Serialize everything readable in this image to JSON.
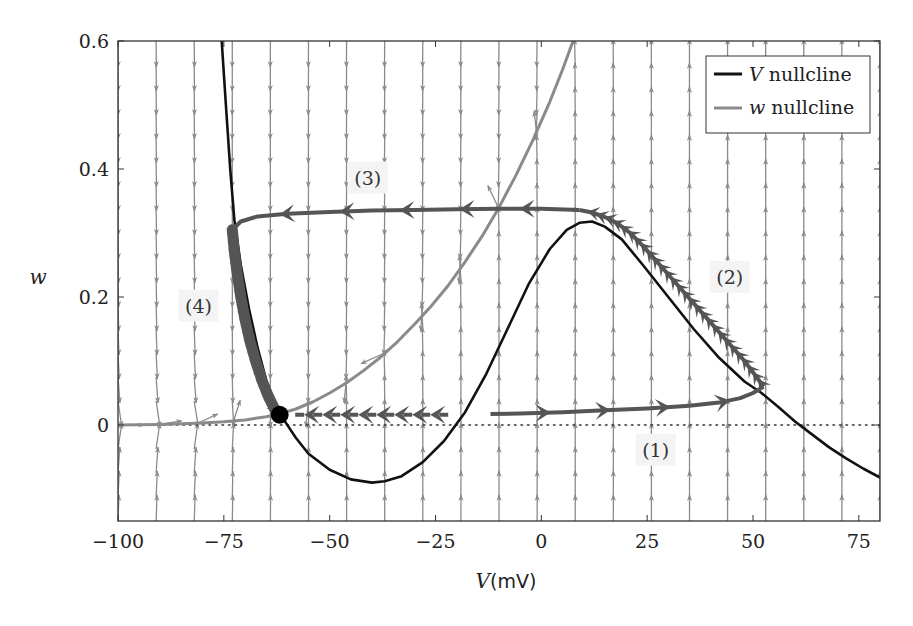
{
  "chart_data": {
    "type": "line",
    "title": "",
    "xlabel": "V",
    "xlabel_unit": "(mV)",
    "ylabel": "w",
    "xlim": [
      -100,
      80
    ],
    "ylim": [
      -0.15,
      0.6
    ],
    "xticks": [
      -100,
      -75,
      -50,
      -25,
      0,
      25,
      50,
      75
    ],
    "xtick_labels": [
      "−100",
      "−75",
      "−50",
      "−25",
      "0",
      "25",
      "50",
      "75"
    ],
    "yticks": [
      0,
      0.2,
      0.4,
      0.6
    ],
    "ytick_labels": [
      "0",
      "0.2",
      "0.4",
      "0.6"
    ],
    "grid": false,
    "legend": {
      "placement": "top-right",
      "entries": [
        {
          "name": "V nullcline",
          "symbol": "V",
          "text": "nullcline",
          "color": "#111111"
        },
        {
          "name": "w nullcline",
          "symbol": "w",
          "text": "nullcline",
          "color": "#8a8a8a"
        }
      ]
    },
    "series": [
      {
        "name": "V nullcline",
        "color": "#111111",
        "x": [
          -75.5,
          -74.5,
          -73.5,
          -72.5,
          -71,
          -69,
          -67,
          -65,
          -63,
          -61,
          -58,
          -55,
          -50,
          -45,
          -40,
          -37,
          -33,
          -28,
          -23,
          -18,
          -13,
          -8,
          -3,
          2,
          6,
          9,
          12,
          15,
          19,
          24,
          30,
          36,
          42,
          48,
          52,
          56,
          60,
          64,
          68,
          72,
          76,
          80
        ],
        "y": [
          0.6,
          0.5,
          0.4,
          0.32,
          0.25,
          0.18,
          0.12,
          0.07,
          0.035,
          0.01,
          -0.02,
          -0.045,
          -0.07,
          -0.085,
          -0.09,
          -0.088,
          -0.08,
          -0.058,
          -0.025,
          0.02,
          0.08,
          0.15,
          0.22,
          0.275,
          0.305,
          0.316,
          0.318,
          0.31,
          0.29,
          0.25,
          0.2,
          0.15,
          0.105,
          0.068,
          0.05,
          0.028,
          0.005,
          -0.015,
          -0.035,
          -0.052,
          -0.068,
          -0.082
        ]
      },
      {
        "name": "w nullcline",
        "color": "#8a8a8a",
        "x": [
          -100,
          -90,
          -80,
          -75,
          -70,
          -65,
          -62,
          -58,
          -54,
          -50,
          -46,
          -42,
          -38,
          -34,
          -30,
          -26,
          -22,
          -18,
          -14,
          -10,
          -6,
          -2,
          2,
          5,
          7.5
        ],
        "y": [
          0.0,
          0.001,
          0.003,
          0.005,
          0.008,
          0.013,
          0.017,
          0.025,
          0.036,
          0.05,
          0.066,
          0.085,
          0.106,
          0.13,
          0.157,
          0.186,
          0.218,
          0.255,
          0.295,
          0.34,
          0.39,
          0.445,
          0.505,
          0.555,
          0.6
        ]
      },
      {
        "name": "w = 0 reference",
        "style": "dotted",
        "color": "#333333",
        "x": [
          -100,
          80
        ],
        "y": [
          0.0,
          0.0
        ]
      }
    ],
    "trajectories": [
      {
        "label": "(1)",
        "style": "solid",
        "direction": "forward",
        "x": [
          -12,
          -5,
          5,
          15,
          25,
          35,
          42,
          47,
          50,
          52.5
        ],
        "y": [
          0.017,
          0.018,
          0.02,
          0.023,
          0.026,
          0.03,
          0.035,
          0.042,
          0.05,
          0.06
        ]
      },
      {
        "label": "(1) initial dashed",
        "style": "dashed",
        "direction": "forward",
        "x": [
          -22,
          -30,
          -40,
          -50,
          -56,
          -60
        ],
        "y": [
          0.016,
          0.016,
          0.016,
          0.016,
          0.016,
          0.016
        ]
      },
      {
        "label": "(2)",
        "style": "solid",
        "direction": "forward",
        "x": [
          52.5,
          48,
          44,
          40,
          36,
          32,
          28,
          24,
          21,
          18,
          15,
          12,
          9
        ],
        "y": [
          0.06,
          0.1,
          0.13,
          0.16,
          0.19,
          0.22,
          0.25,
          0.28,
          0.3,
          0.315,
          0.325,
          0.332,
          0.336
        ]
      },
      {
        "label": "(3)",
        "style": "solid",
        "direction": "forward",
        "x": [
          9,
          0,
          -10,
          -20,
          -30,
          -40,
          -50,
          -60,
          -67,
          -71,
          -73
        ],
        "y": [
          0.336,
          0.338,
          0.338,
          0.337,
          0.336,
          0.335,
          0.333,
          0.33,
          0.326,
          0.318,
          0.305
        ]
      },
      {
        "label": "(4)",
        "style": "thick",
        "direction": "forward",
        "x": [
          -73,
          -72.5,
          -71.8,
          -71,
          -70,
          -68.8,
          -67.5,
          -66,
          -64.5,
          -63,
          -61.8
        ],
        "y": [
          0.305,
          0.27,
          0.235,
          0.2,
          0.165,
          0.13,
          0.1,
          0.07,
          0.045,
          0.025,
          0.016
        ]
      }
    ],
    "fixed_point": {
      "x": -61.8,
      "y": 0.016,
      "color": "#000000"
    },
    "annotations": [
      {
        "text": "(1)",
        "x": 27,
        "y": -0.04
      },
      {
        "text": "(2)",
        "x": 44.5,
        "y": 0.23
      },
      {
        "text": "(3)",
        "x": -41,
        "y": 0.385
      },
      {
        "text": "(4)",
        "x": -81,
        "y": 0.185
      }
    ],
    "vector_field": {
      "columns": 21,
      "rows": 21,
      "x_range": [
        -100,
        80
      ],
      "y_range": [
        -0.15,
        0.6
      ],
      "color": "#8a8a8a"
    }
  }
}
